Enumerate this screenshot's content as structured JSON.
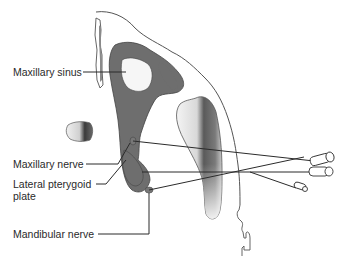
{
  "diagram": {
    "type": "anatomical-illustration",
    "colors": {
      "outline": "#4a4a4a",
      "bone_dark": "#6e6e6e",
      "background": "#ffffff",
      "needle": "#2b2b2b"
    },
    "labels": [
      {
        "id": "maxillary-sinus",
        "text": "Maxillary sinus"
      },
      {
        "id": "maxillary-nerve",
        "text": "Maxillary nerve"
      },
      {
        "id": "lateral-pterygoid-plate-line1",
        "text": "Lateral pterygoid"
      },
      {
        "id": "lateral-pterygoid-plate-line2",
        "text": "plate"
      },
      {
        "id": "mandibular-nerve",
        "text": "Mandibular nerve"
      }
    ],
    "needles": [
      {
        "target": "maxillary-nerve",
        "count": 1
      },
      {
        "target": "lateral-pterygoid-plate",
        "count": 1
      },
      {
        "target": "mandibular-nerve",
        "count": 1
      }
    ]
  }
}
